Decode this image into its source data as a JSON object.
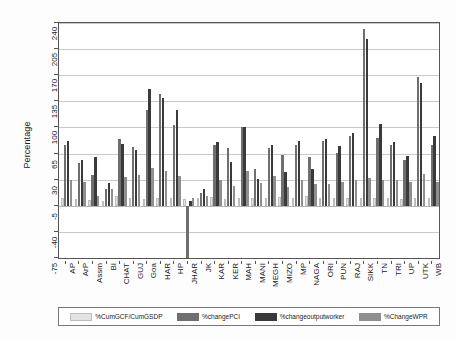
{
  "chart_data": {
    "type": "bar",
    "title": "",
    "xlabel": "",
    "ylabel": "Percentage",
    "ylim": [
      -75,
      240
    ],
    "yticks": [
      -75,
      -40,
      -5,
      30,
      65,
      100,
      135,
      170,
      205,
      240
    ],
    "grid": true,
    "legend_position": "bottom",
    "categories": [
      "AP",
      "ArP",
      "Assm",
      "BI",
      "CHAT",
      "GUJ",
      "Goa",
      "HAR",
      "HP",
      "JHAR",
      "JK",
      "KAR",
      "KER",
      "MAH",
      "MANI",
      "MEGH",
      "MIZO",
      "MP",
      "NAGA",
      "ORI",
      "PUN",
      "RAJ",
      "SIKK",
      "TN",
      "TRI",
      "UP",
      "UTK",
      "WB"
    ],
    "series": [
      {
        "name": "%CumGCF/CumGSDP",
        "color": "#e3e3e3",
        "values": [
          6,
          4,
          3,
          2,
          8,
          6,
          4,
          5,
          5,
          4,
          6,
          7,
          4,
          5,
          6,
          5,
          7,
          5,
          8,
          6,
          5,
          6,
          5,
          6,
          5,
          4,
          6,
          5
        ]
      },
      {
        "name": "%changePCI",
        "color": "#6f6f6f",
        "values": [
          77,
          52,
          36,
          18,
          85,
          74,
          124,
          145,
          103,
          -78,
          12,
          76,
          72,
          101,
          44,
          72,
          63,
          76,
          60,
          82,
          66,
          88,
          232,
          86,
          76,
          56,
          167,
          76
        ]
      },
      {
        "name": "%changeoutputworker",
        "color": "#3a3a3a",
        "values": [
          82,
          57,
          60,
          26,
          78,
          70,
          152,
          140,
          124,
          1,
          18,
          80,
          54,
          101,
          31,
          76,
          40,
          82,
          44,
          85,
          75,
          92,
          218,
          104,
          81,
          62,
          160,
          88
        ]
      },
      {
        "name": "%ChangeWPR",
        "color": "#8f8f8f",
        "values": [
          29,
          27,
          8,
          17,
          33,
          36,
          45,
          41,
          35,
          5,
          8,
          30,
          21,
          42,
          26,
          35,
          20,
          30,
          24,
          24,
          27,
          29,
          32,
          30,
          30,
          27,
          37,
          27
        ]
      }
    ]
  },
  "legend": {
    "entries": [
      {
        "label": "%CumGCF/CumGSDP"
      },
      {
        "label": "%changePCI"
      },
      {
        "label": "%changeoutputworker"
      },
      {
        "label": "%ChangeWPR"
      }
    ]
  }
}
